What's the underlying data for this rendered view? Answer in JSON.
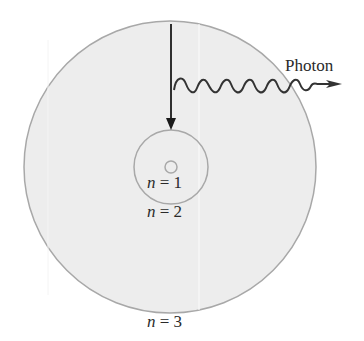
{
  "diagram": {
    "labels": {
      "photon": "Photon",
      "n1_var": "n",
      "n1_eq": " = 1",
      "n2_var": "n",
      "n2_eq": " = 2",
      "n3_var": "n",
      "n3_eq": " = 3"
    },
    "colors": {
      "orbit_fill": "#ededed",
      "orbit_stroke": "#a8a8a8",
      "arrow": "#1a1a1a",
      "wave": "#333333",
      "text": "#2a2a2a"
    },
    "orbits": [
      {
        "level": 1,
        "radius": 6
      },
      {
        "level": 2,
        "radius": 37
      },
      {
        "level": 3,
        "radius": 146
      }
    ]
  }
}
